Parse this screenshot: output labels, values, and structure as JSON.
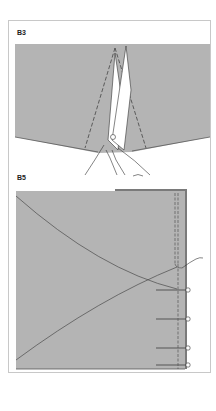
{
  "figure": {
    "panels": [
      {
        "id": "B3",
        "label": "B3",
        "description": "Scissors cutting a wedge (dart) between two dashed lines in fabric"
      },
      {
        "id": "B5",
        "label": "B5",
        "description": "Fabric panel with curved seam lines meeting at a point, pinned along the right edge with dashed stitch lines"
      }
    ],
    "colors": {
      "fabric": "#b4b4b4",
      "fabric_dark_edge": "#7a7a7a",
      "line": "#4a4a4a",
      "border": "#c8c8c8",
      "background": "#ffffff"
    },
    "pins_count": 4
  }
}
